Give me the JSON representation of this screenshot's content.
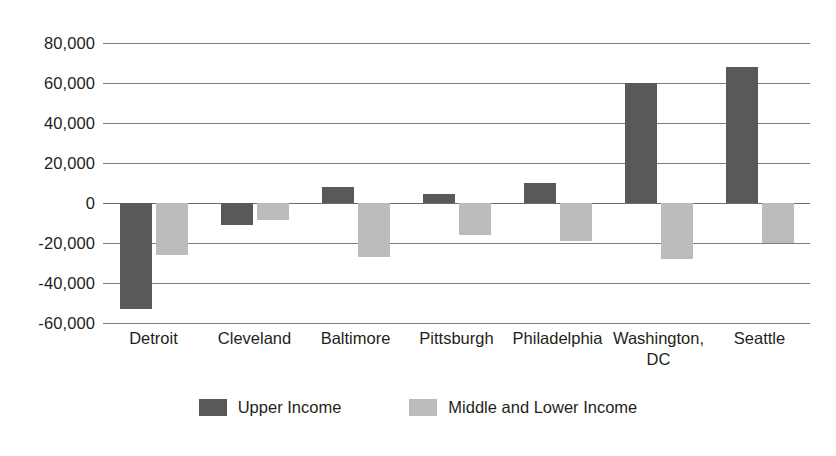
{
  "chart_data": {
    "type": "bar",
    "title": "",
    "subtitle": "",
    "xlabel": "",
    "ylabel": "",
    "ylim": [
      -60000,
      80000
    ],
    "ytick_step": 20000,
    "ytick_labels": [
      "80,000",
      "60,000",
      "40,000",
      "20,000",
      "0",
      "-20,000",
      "-40,000",
      "-60,000"
    ],
    "ytick_values": [
      80000,
      60000,
      40000,
      20000,
      0,
      -20000,
      -40000,
      -60000
    ],
    "grid": true,
    "legend_position": "bottom-center",
    "categories": [
      "Detroit",
      "Cleveland",
      "Baltimore",
      "Pittsburgh",
      "Philadelphia",
      "Washington, DC",
      "Seattle"
    ],
    "category_lines": [
      [
        "Detroit"
      ],
      [
        "Cleveland"
      ],
      [
        "Baltimore"
      ],
      [
        "Pittsburgh"
      ],
      [
        "Philadelphia"
      ],
      [
        "Washington,",
        "DC"
      ],
      [
        "Seattle"
      ]
    ],
    "series": [
      {
        "name": "Upper Income",
        "color": "#595959",
        "values": [
          -53000,
          -11000,
          8000,
          4500,
          10000,
          60000,
          68000
        ]
      },
      {
        "name": "Middle and Lower Income",
        "color": "#bcbcbc",
        "values": [
          -26000,
          -8500,
          -27000,
          -16000,
          -19000,
          -28000,
          -20000
        ]
      }
    ]
  },
  "legend": {
    "items": [
      {
        "label": "Upper Income",
        "swatch": "upper"
      },
      {
        "label": "Middle and Lower Income",
        "swatch": "middle"
      }
    ]
  },
  "colors": {
    "upper_income": "#595959",
    "middle_lower_income": "#bcbcbc",
    "gridline": "#7d7d7d",
    "text": "#231f20",
    "background": "#ffffff"
  }
}
